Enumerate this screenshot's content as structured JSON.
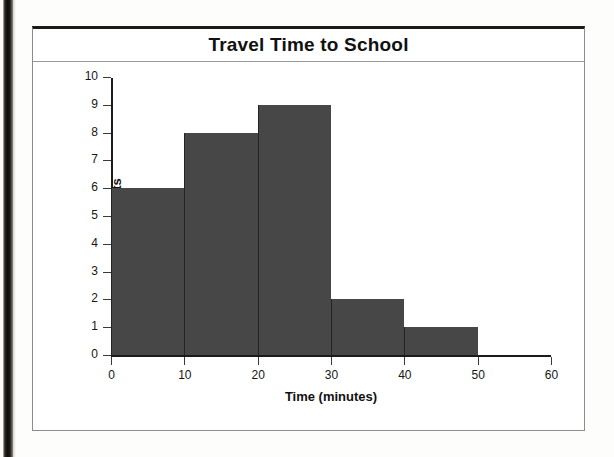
{
  "page": {
    "background_color": "#fdfdfb",
    "scan_band_color": "#100f0d"
  },
  "chart_data": {
    "type": "bar",
    "title": "Travel Time to School",
    "xlabel": "Time (minutes)",
    "ylabel": "Frequency of students",
    "bin_edges": [
      0,
      10,
      20,
      30,
      40,
      50,
      60
    ],
    "categories": [
      "0-10",
      "10-20",
      "20-30",
      "30-40",
      "40-50",
      "50-60"
    ],
    "values": [
      6,
      8,
      9,
      2,
      1,
      0
    ],
    "xlim": [
      0,
      60
    ],
    "ylim": [
      0,
      10
    ],
    "xticks": [
      "0",
      "10",
      "20",
      "30",
      "40",
      "50",
      "60"
    ],
    "xtick_values": [
      0,
      10,
      20,
      30,
      40,
      50,
      60
    ],
    "yticks": [
      "0",
      "1",
      "2",
      "3",
      "4",
      "5",
      "6",
      "7",
      "8",
      "9",
      "10"
    ],
    "ytick_values": [
      0,
      1,
      2,
      3,
      4,
      5,
      6,
      7,
      8,
      9,
      10
    ],
    "grid": false,
    "legend": false,
    "bar_color": "#474747",
    "axis_color": "#1b1b1b",
    "frame_border_color": "#8d8d8d"
  }
}
